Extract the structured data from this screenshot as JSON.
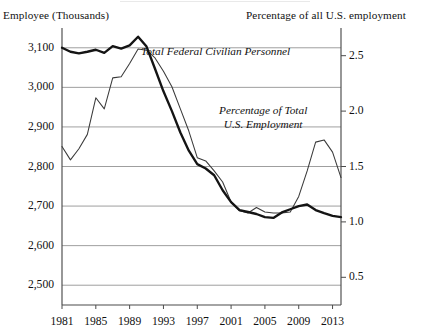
{
  "axis_captions": {
    "left": "Employee (Thousands)",
    "right": "Percentage of all U.S. employment"
  },
  "annotations": {
    "personnel": "Total Federal Civilian Personnel",
    "percentage_line1": "Percentage of Total",
    "percentage_line2": "U.S. Employment"
  },
  "colors": {
    "personnel_line": "#141414",
    "percentage_line": "#3a3a3a",
    "grid": "#8e8e8e",
    "frame": "#4b4b4b",
    "background": "#ffffff"
  },
  "chart_data": {
    "type": "line",
    "title": "",
    "xlabel": "",
    "ylabel": "Employee (Thousands)",
    "y2label": "Percentage of all U.S. employment",
    "grid": true,
    "legend": "inline-annotations",
    "xlim": [
      1981,
      2014
    ],
    "ylim": [
      2450,
      3150
    ],
    "y2lim": [
      0.25,
      2.75
    ],
    "yticks": [
      "3,100",
      "3,000",
      "2,900",
      "2,800",
      "2,700",
      "2,600",
      "2,500"
    ],
    "ytick_values": [
      3100,
      3000,
      2900,
      2800,
      2700,
      2600,
      2500
    ],
    "y2ticks": [
      "2.5",
      "2.0",
      "1.5",
      "1.0",
      "0.5"
    ],
    "y2tick_values": [
      2.5,
      2.0,
      1.5,
      1.0,
      0.5
    ],
    "xticks": [
      "1981",
      "1985",
      "1989",
      "1993",
      "1997",
      "2001",
      "2005",
      "2009",
      "2013"
    ],
    "xtick_values": [
      1981,
      1985,
      1989,
      1993,
      1997,
      2001,
      2005,
      2009,
      2013
    ],
    "x": [
      1981,
      1982,
      1983,
      1984,
      1985,
      1986,
      1987,
      1988,
      1989,
      1990,
      1991,
      1992,
      1993,
      1994,
      1995,
      1996,
      1997,
      1998,
      1999,
      2000,
      2001,
      2002,
      2003,
      2004,
      2005,
      2006,
      2007,
      2008,
      2009,
      2010,
      2011,
      2012,
      2013,
      2014
    ],
    "series": [
      {
        "name": "Total Federal Civilian Personnel",
        "axis": "left",
        "units": "thousands of employees",
        "style": "thick",
        "values": [
          3100,
          3090,
          3086,
          3090,
          3095,
          3087,
          3104,
          3098,
          3106,
          3128,
          3103,
          3047,
          2990,
          2940,
          2886,
          2840,
          2806,
          2795,
          2778,
          2740,
          2710,
          2690,
          2685,
          2680,
          2672,
          2670,
          2684,
          2692,
          2700,
          2704,
          2690,
          2682,
          2675,
          2672
        ]
      },
      {
        "name": "Percentage of Total U.S. Employment",
        "axis": "right",
        "units": "percent",
        "style": "thin",
        "values": [
          1.68,
          1.56,
          1.66,
          1.79,
          2.12,
          2.02,
          2.3,
          2.31,
          2.43,
          2.56,
          2.55,
          2.48,
          2.36,
          2.22,
          2.02,
          1.82,
          1.58,
          1.55,
          1.46,
          1.36,
          1.18,
          1.1,
          1.08,
          1.13,
          1.09,
          1.08,
          1.08,
          1.09,
          1.23,
          1.46,
          1.72,
          1.74,
          1.63,
          1.4
        ]
      }
    ]
  }
}
